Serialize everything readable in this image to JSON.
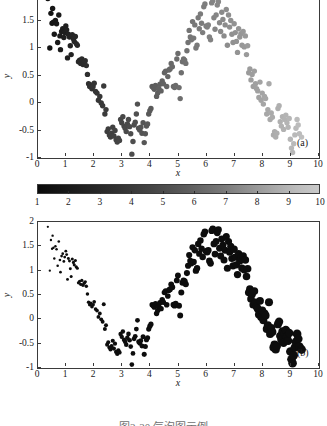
{
  "figure": {
    "caption": "图2-20 气泡图示例",
    "background": "#ffffff",
    "axis_color": "#3a3a3a"
  },
  "panels": [
    {
      "tag": "(a)",
      "xlabel": "x",
      "ylabel": "y",
      "xticks": [
        "0",
        "1",
        "2",
        "3",
        "4",
        "5",
        "6",
        "7",
        "8",
        "9",
        "10"
      ],
      "yticks": [
        "-1",
        "-0.5",
        "0",
        "0.5",
        "1",
        "1.5",
        "2"
      ]
    },
    {
      "tag": "(b)",
      "xlabel": "x",
      "ylabel": "y",
      "xticks": [
        "0",
        "1",
        "2",
        "3",
        "4",
        "5",
        "6",
        "7",
        "8",
        "9",
        "10"
      ],
      "yticks": [
        "-1",
        "-0.5",
        "0",
        "0.5",
        "1",
        "1.5",
        "2"
      ]
    }
  ],
  "colorbar": {
    "ticks": [
      "1",
      "2",
      "3",
      "4",
      "5",
      "6",
      "7",
      "8",
      "9",
      "10"
    ],
    "min_label": "1",
    "max_label": "10",
    "low_color": "#0a0a0a",
    "high_color": "#c9c9c9"
  },
  "chart_data": {
    "type": "scatter",
    "title": "",
    "subtitle": "",
    "panel_count": 2,
    "shared_x": true,
    "xlabel": "x",
    "ylabel": "y",
    "xlim": [
      0,
      10
    ],
    "ylim": [
      -1,
      2
    ],
    "xticks": [
      0,
      1,
      2,
      3,
      4,
      5,
      6,
      7,
      8,
      9,
      10
    ],
    "yticks": [
      -1,
      -0.5,
      0,
      0.5,
      1,
      1.5,
      2
    ],
    "grid": false,
    "legend": null,
    "encodings": {
      "panel_a": "third variable mapped to marker grayscale color (colorbar 1-10, black=1 to light gray=10)",
      "panel_b": "third variable mapped to marker size (small=1 to large=10)"
    },
    "colorbar": {
      "range": [
        1,
        10
      ],
      "ticks": [
        1,
        2,
        3,
        4,
        5,
        6,
        7,
        8,
        9,
        10
      ],
      "colormap": "grayscale-bone"
    },
    "marker_size_range_px": [
      0.9,
      4.6
    ],
    "annotations": [
      {
        "text": "(a)",
        "panel": 0
      },
      {
        "text": "(b)",
        "panel": 1
      }
    ],
    "note": "Both panels plot the identical (x, y, z) triples; z equals x so the encoded variable grows left to right.",
    "points": [
      [
        0.35,
        1.9
      ],
      [
        0.42,
        1.0
      ],
      [
        0.46,
        1.63
      ],
      [
        0.5,
        1.45
      ],
      [
        0.52,
        1.72
      ],
      [
        0.55,
        1.47
      ],
      [
        0.58,
        1.25
      ],
      [
        0.62,
        1.5
      ],
      [
        0.66,
        1.44
      ],
      [
        0.7,
        1.1
      ],
      [
        0.74,
        1.6
      ],
      [
        0.78,
        1.22
      ],
      [
        0.8,
        0.97
      ],
      [
        0.84,
        1.3
      ],
      [
        0.88,
        1.35
      ],
      [
        0.92,
        1.19
      ],
      [
        0.95,
        1.28
      ],
      [
        0.99,
        1.4
      ],
      [
        1.02,
        1.33
      ],
      [
        1.05,
        0.82
      ],
      [
        1.08,
        1.25
      ],
      [
        1.12,
        1.2
      ],
      [
        1.15,
        1.04
      ],
      [
        1.18,
        0.88
      ],
      [
        1.22,
        1.24
      ],
      [
        1.26,
        1.17
      ],
      [
        1.29,
        1.12
      ],
      [
        1.33,
        1.21
      ],
      [
        1.36,
        1.08
      ],
      [
        1.4,
        1.05
      ],
      [
        1.44,
        0.75
      ],
      [
        1.48,
        0.78
      ],
      [
        1.52,
        0.72
      ],
      [
        1.56,
        0.8
      ],
      [
        1.6,
        0.7
      ],
      [
        1.64,
        0.74
      ],
      [
        1.68,
        0.77
      ],
      [
        1.72,
        0.68
      ],
      [
        1.76,
        0.52
      ],
      [
        1.8,
        0.35
      ],
      [
        1.84,
        0.3
      ],
      [
        1.88,
        0.33
      ],
      [
        1.92,
        0.26
      ],
      [
        1.96,
        0.3
      ],
      [
        2.0,
        0.36
      ],
      [
        2.05,
        0.21
      ],
      [
        2.1,
        0.18
      ],
      [
        2.15,
        0.05
      ],
      [
        2.2,
        0.12
      ],
      [
        2.25,
        0.0
      ],
      [
        2.3,
        -0.05
      ],
      [
        2.34,
        0.31
      ],
      [
        2.38,
        -0.2
      ],
      [
        2.42,
        -0.12
      ],
      [
        2.46,
        -0.52
      ],
      [
        2.5,
        -0.47
      ],
      [
        2.54,
        -0.58
      ],
      [
        2.58,
        -0.62
      ],
      [
        2.62,
        -0.55
      ],
      [
        2.66,
        -0.44
      ],
      [
        2.7,
        -0.6
      ],
      [
        2.74,
        -0.5
      ],
      [
        2.78,
        -0.67
      ],
      [
        2.82,
        -0.71
      ],
      [
        2.86,
        -0.64
      ],
      [
        2.9,
        -0.68
      ],
      [
        2.94,
        -0.3
      ],
      [
        2.98,
        -0.36
      ],
      [
        3.02,
        -0.25
      ],
      [
        3.06,
        -0.42
      ],
      [
        3.1,
        -0.46
      ],
      [
        3.14,
        -0.52
      ],
      [
        3.18,
        -0.38
      ],
      [
        3.22,
        -0.3
      ],
      [
        3.26,
        -0.43
      ],
      [
        3.3,
        -0.56
      ],
      [
        3.34,
        -0.93
      ],
      [
        3.38,
        -0.7
      ],
      [
        3.42,
        -0.4
      ],
      [
        3.46,
        -0.35
      ],
      [
        3.5,
        -0.2
      ],
      [
        3.54,
        -0.02
      ],
      [
        3.58,
        -0.46
      ],
      [
        3.62,
        -0.49
      ],
      [
        3.66,
        -0.44
      ],
      [
        3.7,
        -0.55
      ],
      [
        3.74,
        -0.36
      ],
      [
        3.78,
        -0.72
      ],
      [
        3.82,
        -0.56
      ],
      [
        3.86,
        -0.42
      ],
      [
        3.9,
        -0.38
      ],
      [
        3.94,
        -0.2
      ],
      [
        3.98,
        -0.14
      ],
      [
        4.02,
        -0.1
      ],
      [
        4.06,
        0.3
      ],
      [
        4.1,
        0.28
      ],
      [
        4.14,
        0.25
      ],
      [
        4.18,
        0.32
      ],
      [
        4.22,
        0.12
      ],
      [
        4.26,
        0.18
      ],
      [
        4.3,
        0.26
      ],
      [
        4.34,
        0.34
      ],
      [
        4.38,
        0.22
      ],
      [
        4.42,
        0.4
      ],
      [
        4.46,
        0.35
      ],
      [
        4.5,
        0.55
      ],
      [
        4.54,
        0.58
      ],
      [
        4.58,
        0.3
      ],
      [
        4.62,
        0.48
      ],
      [
        4.66,
        0.6
      ],
      [
        4.7,
        0.62
      ],
      [
        4.74,
        0.72
      ],
      [
        4.78,
        0.66
      ],
      [
        4.82,
        0.3
      ],
      [
        4.86,
        0.28
      ],
      [
        4.9,
        0.32
      ],
      [
        4.94,
        0.8
      ],
      [
        4.98,
        0.9
      ],
      [
        5.02,
        0.28
      ],
      [
        5.06,
        0.08
      ],
      [
        5.1,
        0.55
      ],
      [
        5.14,
        0.75
      ],
      [
        5.18,
        0.8
      ],
      [
        5.22,
        0.78
      ],
      [
        5.26,
        0.72
      ],
      [
        5.3,
        0.95
      ],
      [
        5.34,
        1.1
      ],
      [
        5.38,
        1.32
      ],
      [
        5.42,
        1.2
      ],
      [
        5.46,
        1.15
      ],
      [
        5.5,
        1.48
      ],
      [
        5.54,
        1.18
      ],
      [
        5.58,
        1.42
      ],
      [
        5.62,
        1.0
      ],
      [
        5.66,
        1.05
      ],
      [
        5.7,
        1.55
      ],
      [
        5.74,
        1.35
      ],
      [
        5.78,
        1.62
      ],
      [
        5.82,
        1.45
      ],
      [
        5.86,
        1.28
      ],
      [
        5.9,
        1.75
      ],
      [
        5.94,
        1.8
      ],
      [
        5.98,
        1.4
      ],
      [
        6.02,
        1.38
      ],
      [
        6.06,
        1.42
      ],
      [
        6.1,
        1.2
      ],
      [
        6.14,
        1.15
      ],
      [
        6.18,
        1.82
      ],
      [
        6.22,
        1.86
      ],
      [
        6.26,
        1.55
      ],
      [
        6.3,
        1.34
      ],
      [
        6.34,
        1.6
      ],
      [
        6.38,
        1.78
      ],
      [
        6.42,
        1.84
      ],
      [
        6.46,
        1.46
      ],
      [
        6.5,
        1.3
      ],
      [
        6.54,
        1.65
      ],
      [
        6.58,
        1.52
      ],
      [
        6.62,
        1.22
      ],
      [
        6.66,
        1.42
      ],
      [
        6.7,
        1.7
      ],
      [
        6.74,
        1.05
      ],
      [
        6.78,
        1.6
      ],
      [
        6.82,
        1.38
      ],
      [
        6.86,
        1.5
      ],
      [
        6.9,
        1.25
      ],
      [
        6.94,
        1.1
      ],
      [
        6.98,
        1.44
      ],
      [
        7.02,
        1.28
      ],
      [
        7.06,
        1.12
      ],
      [
        7.1,
        0.92
      ],
      [
        7.14,
        1.35
      ],
      [
        7.18,
        1.2
      ],
      [
        7.22,
        1.26
      ],
      [
        7.26,
        1.05
      ],
      [
        7.3,
        1.3
      ],
      [
        7.34,
        1.02
      ],
      [
        7.38,
        1.22
      ],
      [
        7.42,
        0.88
      ],
      [
        7.46,
        1.04
      ],
      [
        7.5,
        0.55
      ],
      [
        7.54,
        0.62
      ],
      [
        7.58,
        0.42
      ],
      [
        7.62,
        0.52
      ],
      [
        7.66,
        0.3
      ],
      [
        7.7,
        0.58
      ],
      [
        7.74,
        0.35
      ],
      [
        7.78,
        0.26
      ],
      [
        7.82,
        0.22
      ],
      [
        7.86,
        0.1
      ],
      [
        7.9,
        0.38
      ],
      [
        7.94,
        0.05
      ],
      [
        7.98,
        0.18
      ],
      [
        8.02,
        -0.02
      ],
      [
        8.06,
        0.12
      ],
      [
        8.1,
        0.08
      ],
      [
        8.14,
        -0.2
      ],
      [
        8.18,
        -0.12
      ],
      [
        8.22,
        0.35
      ],
      [
        8.26,
        -0.3
      ],
      [
        8.3,
        -0.18
      ],
      [
        8.34,
        -0.26
      ],
      [
        8.38,
        -0.58
      ],
      [
        8.42,
        -0.52
      ],
      [
        8.46,
        -0.62
      ],
      [
        8.5,
        -0.55
      ],
      [
        8.54,
        -0.1
      ],
      [
        8.58,
        -0.05
      ],
      [
        8.62,
        -0.34
      ],
      [
        8.66,
        -0.42
      ],
      [
        8.7,
        -0.25
      ],
      [
        8.74,
        -0.48
      ],
      [
        8.78,
        -0.3
      ],
      [
        8.82,
        -0.22
      ],
      [
        8.86,
        -0.36
      ],
      [
        8.9,
        -0.44
      ],
      [
        8.94,
        -0.28
      ],
      [
        8.98,
        -0.66
      ],
      [
        9.02,
        -0.82
      ],
      [
        9.06,
        -0.9
      ],
      [
        9.1,
        -0.74
      ],
      [
        9.14,
        -0.58
      ],
      [
        9.18,
        -0.46
      ],
      [
        9.22,
        -0.3
      ],
      [
        9.26,
        -0.4
      ],
      [
        9.3,
        -0.56
      ],
      [
        9.38,
        -0.62
      ]
    ]
  }
}
